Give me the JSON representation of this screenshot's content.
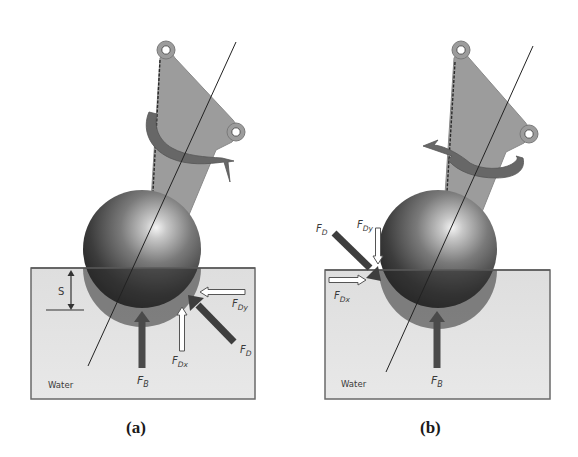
{
  "figure": {
    "panels": [
      {
        "id": "a",
        "caption": "(a)",
        "water_label": "Water",
        "depth_label": "S",
        "force_labels": {
          "buoyancy": "F",
          "buoyancy_sub": "B",
          "drag": "F",
          "drag_sub": "D",
          "drag_x": "F",
          "drag_x_sub": "Dx",
          "drag_y": "F",
          "drag_y_sub": "Dy"
        },
        "rotation_direction": "clockwise"
      },
      {
        "id": "b",
        "caption": "(b)",
        "water_label": "Water",
        "force_labels": {
          "buoyancy": "F",
          "buoyancy_sub": "B",
          "drag": "F",
          "drag_sub": "D",
          "drag_x": "F",
          "drag_x_sub": "Dx",
          "drag_y": "F",
          "drag_y_sub": "Dy"
        },
        "rotation_direction": "counterclockwise"
      }
    ],
    "colors": {
      "water_fill": "#e4e4e4",
      "water_border": "#6a6a6a",
      "link_plate": "#9a9a9a",
      "rotation_arrow": "#6b6b6b",
      "force_arrow_solid": "#4a4a4a",
      "force_arrow_hollow": "#ffffff",
      "sphere_dark": "#2a2a2a",
      "sphere_highlight": "#f2f2f2"
    }
  }
}
